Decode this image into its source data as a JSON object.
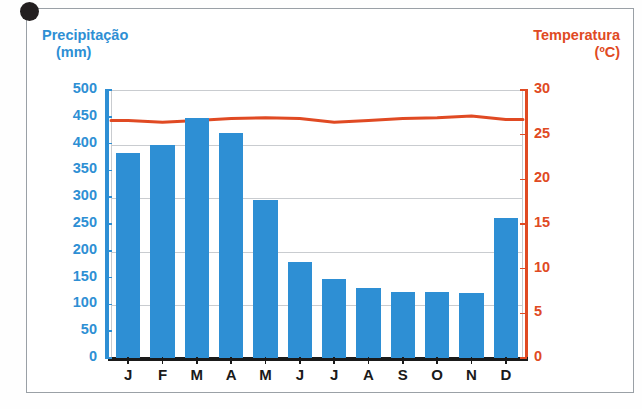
{
  "credit": "ERICSON GUILHERME LUCIANO",
  "left_axis": {
    "title": "Precipitação",
    "unit": "(mm)",
    "color": "#2e8fd4"
  },
  "right_axis": {
    "title": "Temperatura",
    "unit": "(ºC)",
    "color": "#e04a23"
  },
  "chart_data": {
    "type": "bar",
    "title": "",
    "subtitle": "",
    "categories": [
      "J",
      "F",
      "M",
      "A",
      "M",
      "J",
      "J",
      "A",
      "S",
      "O",
      "N",
      "D"
    ],
    "series": [
      {
        "name": "Precipitação",
        "type": "bar",
        "unit": "mm",
        "axis": "left",
        "color": "#2e8fd4",
        "values": [
          383,
          398,
          448,
          420,
          295,
          180,
          148,
          130,
          123,
          123,
          121,
          262
        ]
      },
      {
        "name": "Temperatura",
        "type": "line",
        "unit": "ºC",
        "axis": "right",
        "color": "#e04a23",
        "values": [
          26.6,
          26.4,
          26.6,
          26.8,
          26.9,
          26.8,
          26.4,
          26.6,
          26.8,
          26.9,
          27.1,
          26.7
        ]
      }
    ],
    "xlabel": "",
    "ylabel": "Precipitação (mm)",
    "y2label": "Temperatura (ºC)",
    "ylim": [
      0,
      500
    ],
    "y2lim": [
      0,
      30
    ],
    "yticks": [
      0,
      50,
      100,
      150,
      200,
      250,
      300,
      350,
      400,
      450,
      500
    ],
    "y2ticks": [
      0,
      5,
      10,
      15,
      20,
      25,
      30
    ],
    "gridlines": true,
    "grid_values": [
      100,
      200,
      300,
      400,
      500
    ],
    "legend": "none"
  }
}
